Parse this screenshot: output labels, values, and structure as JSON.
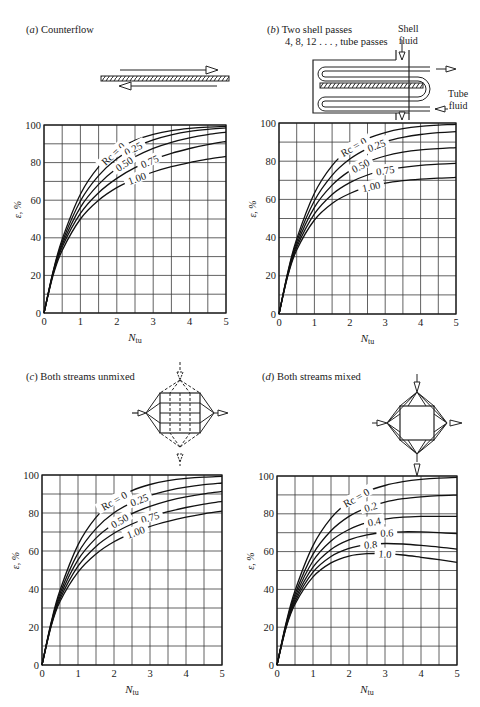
{
  "figure": {
    "panels": [
      {
        "id": "a",
        "letter": "a",
        "title": "Counterflow"
      },
      {
        "id": "b",
        "letter": "b",
        "title_line1": "Two shell passes",
        "title_line2": "4, 8, 12 . . . , tube passes",
        "diagram_labels": {
          "shell_fluid_1": "Shell",
          "shell_fluid_2": "fluid",
          "tube_fluid_1": "Tube",
          "tube_fluid_2": "fluid"
        }
      },
      {
        "id": "c",
        "letter": "c",
        "title": "Both streams unmixed"
      },
      {
        "id": "d",
        "letter": "d",
        "title": "Both streams mixed"
      }
    ]
  },
  "chart_data": [
    {
      "panel": "a",
      "type": "line",
      "title": "(a) Counterflow",
      "xlabel": "N_tu",
      "ylabel": "ε, %",
      "xlim": [
        0,
        5
      ],
      "ylim": [
        0,
        100
      ],
      "xticks": [
        0,
        1,
        2,
        3,
        4,
        5
      ],
      "yticks": [
        0,
        20,
        40,
        60,
        80,
        100
      ],
      "grid": {
        "x_step": 0.5,
        "y_step": 10
      },
      "legend": "inline labels on curves",
      "x": [
        0,
        0.25,
        0.5,
        1,
        1.5,
        2,
        2.5,
        3,
        3.5,
        4,
        4.5,
        5
      ],
      "series": [
        {
          "name": "Rc = 0",
          "label": "Rc = 0",
          "values": [
            0,
            22.1,
            39.3,
            63.2,
            77.7,
            86.5,
            91.8,
            95.0,
            97.0,
            98.2,
            98.9,
            99.3
          ]
        },
        {
          "name": "Rc = 0.25",
          "label": "0.25",
          "values": [
            0,
            21.7,
            37.8,
            59.6,
            73.1,
            82.1,
            88.1,
            92.1,
            94.8,
            96.6,
            97.7,
            98.5
          ]
        },
        {
          "name": "Rc = 0.50",
          "label": "0.50",
          "values": [
            0,
            21.2,
            36.4,
            56.2,
            68.4,
            77.0,
            83.1,
            87.6,
            90.8,
            93.2,
            94.9,
            96.2
          ]
        },
        {
          "name": "Rc = 0.75",
          "label": "0.75",
          "values": [
            0,
            20.8,
            35.1,
            53.0,
            64.0,
            71.6,
            77.3,
            81.6,
            84.9,
            87.5,
            89.6,
            91.2
          ]
        },
        {
          "name": "Rc = 1.00",
          "label": "1.00",
          "values": [
            0,
            20.0,
            33.3,
            50.0,
            60.0,
            66.7,
            71.4,
            75.0,
            77.8,
            80.0,
            81.8,
            83.3
          ]
        }
      ]
    },
    {
      "panel": "b",
      "type": "line",
      "title": "(b) Two shell passes, 4, 8, 12..., tube passes",
      "xlabel": "N_tu",
      "ylabel": "ε, %",
      "xlim": [
        0,
        5
      ],
      "ylim": [
        0,
        100
      ],
      "xticks": [
        0,
        1,
        2,
        3,
        4,
        5
      ],
      "yticks": [
        0,
        20,
        40,
        60,
        80,
        100
      ],
      "grid": {
        "x_step": 0.5,
        "y_step": 10
      },
      "legend": "inline labels on curves",
      "x": [
        0,
        0.25,
        0.5,
        1,
        1.5,
        2,
        2.5,
        3,
        3.5,
        4,
        4.5,
        5
      ],
      "series": [
        {
          "name": "Rc = 0",
          "label": "Rc = 0",
          "values": [
            0,
            22.1,
            39.3,
            63.2,
            77.7,
            86.5,
            91.8,
            95.0,
            97.0,
            98.2,
            98.9,
            99.3
          ]
        },
        {
          "name": "Rc = 0.25",
          "label": "0.25",
          "values": [
            0,
            21.6,
            37.8,
            59.3,
            72.6,
            81.1,
            86.6,
            90.2,
            92.5,
            94.0,
            94.9,
            95.5
          ]
        },
        {
          "name": "Rc = 0.50",
          "label": "0.50",
          "values": [
            0,
            21.1,
            36.3,
            55.8,
            67.5,
            74.9,
            79.6,
            82.7,
            84.7,
            85.9,
            86.6,
            87.1
          ]
        },
        {
          "name": "Rc = 0.75",
          "label": "0.75",
          "values": [
            0,
            20.6,
            34.9,
            52.4,
            62.6,
            68.8,
            72.8,
            75.3,
            76.8,
            77.8,
            78.5,
            78.9
          ]
        },
        {
          "name": "Rc = 1.00",
          "label": "1.00",
          "values": [
            0,
            20.1,
            33.5,
            49.2,
            57.9,
            63.1,
            66.4,
            68.5,
            69.8,
            70.6,
            71.1,
            71.5
          ]
        }
      ]
    },
    {
      "panel": "c",
      "type": "line",
      "title": "(c) Both streams unmixed",
      "xlabel": "N_tu",
      "ylabel": "ε, %",
      "xlim": [
        0,
        5
      ],
      "ylim": [
        0,
        100
      ],
      "xticks": [
        0,
        1,
        2,
        3,
        4,
        5
      ],
      "yticks": [
        0,
        20,
        40,
        60,
        80,
        100
      ],
      "grid": {
        "x_step": 0.5,
        "y_step": 10
      },
      "legend": "inline labels on curves",
      "x": [
        0,
        0.25,
        0.5,
        1,
        1.5,
        2,
        2.5,
        3,
        3.5,
        4,
        4.5,
        5
      ],
      "series": [
        {
          "name": "Rc = 0",
          "label": "Rc = 0",
          "values": [
            0,
            22.1,
            39.3,
            63.2,
            77.7,
            86.5,
            91.8,
            95.0,
            97.0,
            98.2,
            98.9,
            99.3
          ]
        },
        {
          "name": "Rc = 0.25",
          "label": "0.25",
          "values": [
            0,
            21.5,
            37.6,
            58.9,
            71.8,
            80.1,
            85.5,
            89.2,
            91.8,
            93.6,
            94.9,
            95.8
          ]
        },
        {
          "name": "Rc = 0.50",
          "label": "0.50",
          "values": [
            0,
            21.0,
            36.1,
            55.3,
            66.8,
            74.3,
            79.7,
            83.5,
            86.4,
            88.5,
            90.1,
            91.4
          ]
        },
        {
          "name": "Rc = 0.75",
          "label": "0.75",
          "values": [
            0,
            20.5,
            34.7,
            52.0,
            62.4,
            69.3,
            74.2,
            77.9,
            80.7,
            82.9,
            84.7,
            86.1
          ]
        },
        {
          "name": "Rc = 1.00",
          "label": "1.00",
          "values": [
            0,
            20.1,
            33.4,
            48.9,
            58.5,
            64.9,
            69.4,
            72.9,
            75.6,
            77.8,
            79.6,
            81.0
          ]
        }
      ]
    },
    {
      "panel": "d",
      "type": "line",
      "title": "(d) Both streams mixed",
      "xlabel": "N_tu",
      "ylabel": "ε, %",
      "xlim": [
        0,
        5
      ],
      "ylim": [
        0,
        100
      ],
      "xticks": [
        0,
        1,
        2,
        3,
        4,
        5
      ],
      "yticks": [
        0,
        20,
        40,
        60,
        80,
        100
      ],
      "grid": {
        "x_step": 0.5,
        "y_step": 10
      },
      "legend": "inline labels on curves",
      "x": [
        0,
        0.25,
        0.5,
        1,
        1.5,
        2,
        2.5,
        3,
        3.5,
        4,
        4.5,
        5
      ],
      "series": [
        {
          "name": "Rc = 0",
          "label": "Rc = 0",
          "values": [
            0,
            22.1,
            39.3,
            63.2,
            77.7,
            86.5,
            91.8,
            95.0,
            97.0,
            98.2,
            98.9,
            99.3
          ]
        },
        {
          "name": "Rc = 0.2",
          "label": "0.2",
          "values": [
            0,
            21.5,
            37.4,
            58.7,
            71.0,
            78.6,
            83.3,
            86.2,
            88.0,
            89.0,
            89.6,
            89.9
          ]
        },
        {
          "name": "Rc = 0.4",
          "label": "0.4",
          "values": [
            0,
            21.0,
            35.9,
            55.0,
            65.6,
            71.7,
            75.3,
            77.2,
            78.2,
            78.6,
            78.7,
            78.6
          ]
        },
        {
          "name": "Rc = 0.6",
          "label": "0.6",
          "values": [
            0,
            20.4,
            34.6,
            51.8,
            61.1,
            66.2,
            68.9,
            70.1,
            70.5,
            70.4,
            70.0,
            69.5
          ]
        },
        {
          "name": "Rc = 0.8",
          "label": "0.8",
          "values": [
            0,
            20.0,
            33.4,
            49.1,
            57.4,
            61.7,
            63.7,
            64.3,
            64.0,
            63.3,
            62.4,
            61.3
          ]
        },
        {
          "name": "Rc = 1.0",
          "label": "1.0",
          "values": [
            0,
            19.6,
            32.2,
            46.6,
            54.0,
            57.6,
            58.9,
            58.9,
            58.2,
            57.0,
            55.7,
            54.3
          ]
        }
      ]
    }
  ]
}
